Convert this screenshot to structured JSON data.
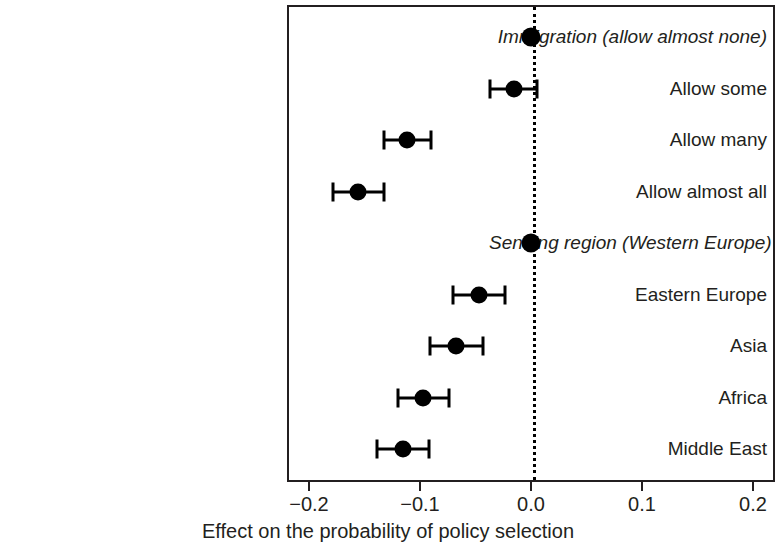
{
  "chart_data": {
    "type": "scatter",
    "orientation": "horizontal",
    "title": "",
    "xlabel": "Effect on the probability of policy selection",
    "ylabel": "",
    "xlim": [
      -0.22,
      0.22
    ],
    "xticks": [
      "-0.2",
      "-0.1",
      "0.0",
      "0.1",
      "0.2"
    ],
    "xtick_values": [
      -0.2,
      -0.1,
      0.0,
      0.1,
      0.2
    ],
    "grid": false,
    "legend": null,
    "zero_reference_line": 0.0,
    "categories": [
      "Immigration (allow almost none)",
      "Allow some",
      "Allow many",
      "Allow almost all",
      "Sending region (Western Europe)",
      "Eastern Europe",
      "Asia",
      "Africa",
      "Middle East"
    ],
    "points": [
      {
        "label": "Immigration (allow almost none)",
        "value": 0.0,
        "ci_low": 0.0,
        "ci_high": 0.0,
        "reference": true
      },
      {
        "label": "Allow some",
        "value": -0.015,
        "ci_low": -0.037,
        "ci_high": 0.005,
        "reference": false
      },
      {
        "label": "Allow many",
        "value": -0.112,
        "ci_low": -0.132,
        "ci_high": -0.09,
        "reference": false
      },
      {
        "label": "Allow almost all",
        "value": -0.156,
        "ci_low": -0.178,
        "ci_high": -0.132,
        "reference": false
      },
      {
        "label": "Sending region (Western Europe)",
        "value": 0.0,
        "ci_low": 0.0,
        "ci_high": 0.0,
        "reference": true
      },
      {
        "label": "Eastern Europe",
        "value": -0.047,
        "ci_low": -0.07,
        "ci_high": -0.023,
        "reference": false
      },
      {
        "label": "Asia",
        "value": -0.068,
        "ci_low": -0.091,
        "ci_high": -0.043,
        "reference": false
      },
      {
        "label": "Africa",
        "value": -0.097,
        "ci_low": -0.12,
        "ci_high": -0.074,
        "reference": false
      },
      {
        "label": "Middle East",
        "value": -0.115,
        "ci_low": -0.139,
        "ci_high": -0.092,
        "reference": false
      }
    ],
    "colors": {
      "point": "#000000",
      "axis": "#231f20",
      "text": "#231f20",
      "background": "#ffffff"
    }
  }
}
